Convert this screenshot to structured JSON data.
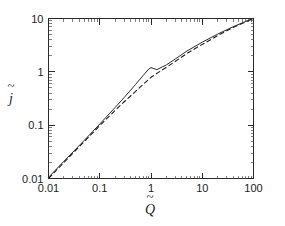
{
  "chart_data": {
    "type": "line",
    "title": "",
    "xlabel": "Q̃",
    "ylabel": "j̃",
    "xscale": "log",
    "yscale": "log",
    "xlim": [
      0.01,
      100
    ],
    "ylim": [
      0.01,
      10
    ],
    "grid": false,
    "legend": null,
    "xticks": [
      0.01,
      0.1,
      1,
      10,
      100
    ],
    "xticklabels": [
      "0.01",
      "0.1",
      "1",
      "10",
      "100"
    ],
    "yticks": [
      0.01,
      0.1,
      1,
      10
    ],
    "yticklabels": [
      "0.01",
      "0.1",
      "1",
      "10"
    ],
    "series": [
      {
        "name": "solid-curve",
        "style": "solid",
        "x": [
          0.01,
          0.02,
          0.05,
          0.1,
          0.2,
          0.3,
          0.5,
          0.7,
          0.9,
          1.0,
          1.3,
          2.0,
          3.0,
          5.0,
          10.0,
          20.0,
          40.0,
          70.0,
          100.0
        ],
        "y": [
          0.0105,
          0.021,
          0.052,
          0.105,
          0.215,
          0.33,
          0.58,
          0.85,
          1.12,
          1.2,
          1.1,
          1.35,
          1.75,
          2.45,
          3.6,
          5.1,
          7.0,
          8.8,
          10.0
        ]
      },
      {
        "name": "dashed-curve",
        "style": "dashed",
        "x": [
          0.01,
          0.02,
          0.05,
          0.1,
          0.2,
          0.3,
          0.5,
          0.7,
          1.0,
          1.5,
          2.0,
          3.0,
          5.0,
          8.0,
          12.0,
          20.0,
          40.0,
          70.0,
          100.0
        ],
        "y": [
          0.01,
          0.02,
          0.0495,
          0.098,
          0.19,
          0.275,
          0.43,
          0.58,
          0.79,
          1.02,
          1.22,
          1.58,
          2.2,
          2.9,
          3.6,
          4.8,
          6.8,
          8.6,
          10.0
        ]
      }
    ]
  }
}
